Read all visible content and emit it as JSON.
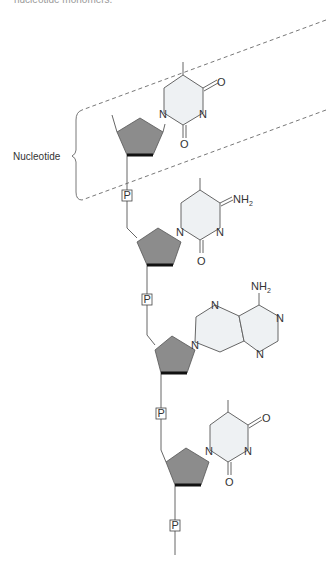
{
  "caption": {
    "top_text": "nucleotide monomers."
  },
  "bracket": {
    "label": "Nucleotide"
  },
  "colors": {
    "sugar": "#8c8c8c",
    "sugar_edge": "#111111",
    "base_ring_fill": "#eef1f3",
    "line": "#666666"
  },
  "nucleotides": [
    {
      "base": "pyrimidine (thymine-like)",
      "atoms": {
        "n1": "N",
        "n3": "N",
        "o2": "O",
        "o4": "O"
      }
    },
    {
      "base": "pyrimidine (cytosine-like)",
      "atoms": {
        "n1": "N",
        "n3": "N",
        "o2": "O",
        "nh2": "NH",
        "nh2_sub": "2"
      }
    },
    {
      "base": "purine (adenine-like)",
      "atoms": {
        "n7": "N",
        "n9": "N",
        "n1": "N",
        "n3": "N",
        "nh2": "NH",
        "nh2_sub": "2"
      }
    },
    {
      "base": "pyrimidine (thymine-like)",
      "atoms": {
        "n1": "N",
        "n3": "N",
        "o2": "O",
        "o4": "O"
      }
    }
  ],
  "phosphate": {
    "label": "P"
  }
}
